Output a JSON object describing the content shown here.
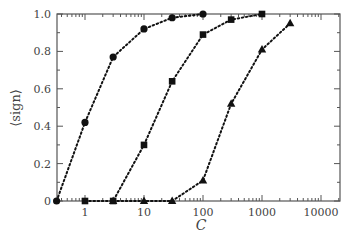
{
  "chart_data": {
    "type": "line",
    "title": "",
    "xlabel": "C",
    "ylabel": "⟨sign⟩",
    "xscale": "log",
    "xlim": [
      0.33,
      20000
    ],
    "ylim": [
      0,
      1.0
    ],
    "grid": false,
    "legend": "none",
    "xticks": [
      "1",
      "10",
      "100",
      "1000",
      "10000"
    ],
    "yticks": [
      "0",
      "0.2",
      "0.4",
      "0.6",
      "0.8",
      "1.0"
    ],
    "line_style": "dotted",
    "series": [
      {
        "name": "circles",
        "marker": "circle",
        "x": [
          0.33,
          1,
          3,
          10,
          30,
          100
        ],
        "y": [
          0,
          0.42,
          0.77,
          0.92,
          0.98,
          1.0
        ]
      },
      {
        "name": "squares",
        "marker": "square",
        "x": [
          1,
          3,
          10,
          30,
          100,
          300,
          1000
        ],
        "y": [
          0,
          0,
          0.3,
          0.64,
          0.89,
          0.97,
          1.0
        ]
      },
      {
        "name": "triangles",
        "marker": "triangle",
        "x": [
          3,
          10,
          30,
          100,
          300,
          1000,
          3000
        ],
        "y": [
          0,
          0,
          0,
          0.11,
          0.52,
          0.81,
          0.95
        ]
      }
    ]
  },
  "colors": {
    "axis": "#555555",
    "series": "#111111"
  }
}
